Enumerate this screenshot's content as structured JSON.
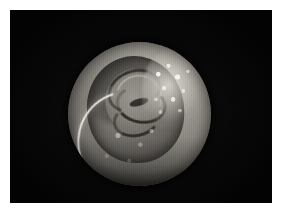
{
  "image": {
    "kind": "photograph",
    "subject": "shell-specimen",
    "description": "Close-up grayscale photograph of a rounded gastropod shell viewed from the aperture side, showing the outer whorl, a deep inner cavity and spiralling columella folds.",
    "color_mode": "grayscale",
    "background_color": "#030303",
    "paper_border_color": "#ffffff",
    "frame": {
      "width_px": 282,
      "height_px": 218,
      "border_px": 10,
      "plate_width_px": 262,
      "plate_height_px": 193
    },
    "specimen": {
      "shape": "circular",
      "center_x_px": 139,
      "center_y_px": 112,
      "radius_px": 72,
      "body_tone": "#908d86",
      "highlight_tone": "#ece9e2",
      "shadow_tone": "#3d3b38",
      "aperture_tone": "#6d6a65",
      "groove_tone": "#221f1e"
    },
    "features": [
      {
        "name": "outer-whorl",
        "label": "Outer whorl",
        "position": "full circumference",
        "tone": "#a6a39b"
      },
      {
        "name": "rim-highlight-upper-right",
        "label": "Bright encrusted rim highlight",
        "position": "upper right",
        "tone": "#ece9e2"
      },
      {
        "name": "aperture-cavity",
        "label": "Aperture cavity",
        "position": "center, offset upper-left",
        "tone": "#6d6a65"
      },
      {
        "name": "columella-folds",
        "label": "Spiral columella folds",
        "position": "center",
        "tone": "#8a8780"
      },
      {
        "name": "crescent-arc",
        "label": "Bright crescent arc",
        "position": "lower left of aperture",
        "tone": "#f4f2ed"
      },
      {
        "name": "scanline-texture",
        "label": "Vertical scan-line texture",
        "position": "overall",
        "tone": "#ffffff"
      }
    ]
  }
}
